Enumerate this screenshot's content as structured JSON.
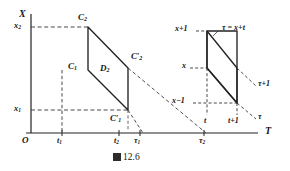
{
  "figure": {
    "caption": "12.6",
    "caption_prefix_glyph": "figure-square-glyph",
    "caption_full": "图 12.6"
  },
  "left_diagram": {
    "axes": {
      "y_axis_label": "X",
      "x_axis_label": "T",
      "origin_label": "O"
    },
    "y_ticks": [
      {
        "label": "x",
        "sub": "2",
        "value_y": 27
      },
      {
        "label": "x",
        "sub": "1",
        "value_y": 110
      }
    ],
    "x_ticks": [
      {
        "label": "t",
        "sub": "1",
        "value_x": 62
      },
      {
        "label": "t",
        "sub": "2",
        "value_x": 119
      },
      {
        "label": "τ",
        "sub": "1",
        "value_x": 140
      },
      {
        "label": "τ",
        "sub": "2",
        "value_x": 204
      }
    ],
    "vertices": [
      {
        "name": "C2",
        "label": "C",
        "sub": "2",
        "prime": false,
        "x": 88,
        "y": 27
      },
      {
        "name": "C2p",
        "label": "C",
        "sub": "2",
        "prime": true,
        "x": 128,
        "y": 68
      },
      {
        "name": "C1",
        "label": "C",
        "sub": "1",
        "prime": false,
        "x": 88,
        "y": 70
      },
      {
        "name": "C1p",
        "label": "C",
        "sub": "1",
        "prime": true,
        "x": 128,
        "y": 110
      }
    ],
    "region_label": {
      "label": "D",
      "sub": "2"
    }
  },
  "right_diagram": {
    "y_labels": [
      {
        "text": "x+1",
        "y": 31
      },
      {
        "text": "x",
        "y": 68
      },
      {
        "text": "x−1",
        "y": 103
      }
    ],
    "x_labels": [
      {
        "text": "t",
        "x": 206
      },
      {
        "text": "t+1",
        "x": 234
      }
    ],
    "annotations": [
      {
        "name": "tau-equals-x-plus-t",
        "text": "τ = x+t"
      },
      {
        "name": "tau-plus-one",
        "text": "τ+1"
      },
      {
        "name": "tau",
        "text": "τ"
      }
    ]
  },
  "colors": {
    "ink": "#1a1a1a",
    "line": "#2a2a2a",
    "dashed": "#3a3a3a",
    "background": "#ffffff"
  }
}
